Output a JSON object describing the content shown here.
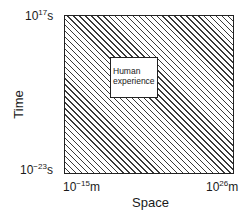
{
  "diagram": {
    "type": "region-diagram",
    "outer_region": {
      "fill": "diagonal-hatch",
      "line_color": "#3a3a3a",
      "border_color": "#222222"
    },
    "inner_region": {
      "label_line1": "Human",
      "label_line2": "experience",
      "fill": "#ffffff"
    },
    "y_axis": {
      "title": "Time",
      "top": {
        "base": "10",
        "exponent": "17",
        "unit": "s"
      },
      "bottom": {
        "base": "10",
        "exponent": "−23",
        "unit": "s"
      }
    },
    "x_axis": {
      "title": "Space",
      "left": {
        "base": "10",
        "exponent": "−15",
        "unit": "m"
      },
      "right": {
        "base": "10",
        "exponent": "26",
        "unit": "m"
      }
    }
  }
}
